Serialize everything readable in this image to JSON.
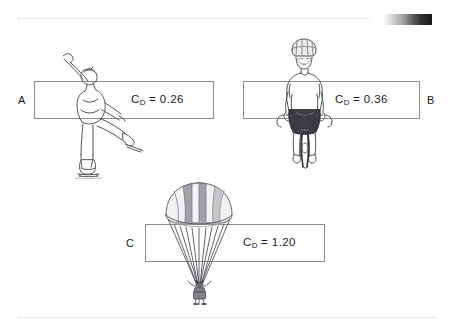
{
  "figure": {
    "background_color": "#ffffff",
    "line_color": "#8d8d8d",
    "text_color": "#1b1b1b",
    "dotted_rule_color": "#c9c9d4"
  },
  "decorations": {
    "gradient_bar": {
      "name": "grayscale-gradient-bar",
      "from_color": "#ffffff",
      "to_color": "#1a1a1a"
    }
  },
  "panels": [
    {
      "letter": "A",
      "subject": "figure-skater",
      "symbol": "C",
      "subscript": "D",
      "equals": "=",
      "value": "0.26",
      "caption": "C_D = 0.26"
    },
    {
      "letter": "B",
      "subject": "cyclist",
      "symbol": "C",
      "subscript": "D",
      "equals": "=",
      "value": "0.36",
      "caption": "C_D = 0.36"
    },
    {
      "letter": "C",
      "subject": "parachutist",
      "symbol": "C",
      "subscript": "D",
      "equals": "=",
      "value": "1.20",
      "caption": "C_D = 1.20"
    }
  ]
}
